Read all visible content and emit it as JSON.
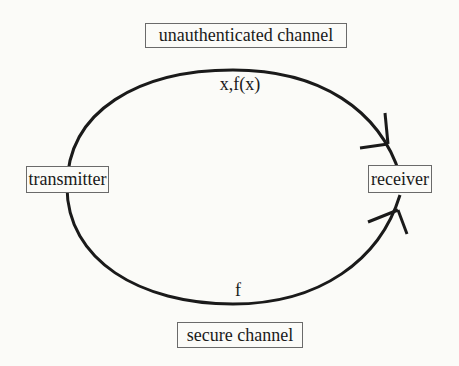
{
  "diagram": {
    "nodes": {
      "unauthenticated_channel": "unauthenticated channel",
      "transmitter": "transmitter",
      "receiver": "receiver",
      "secure_channel": "secure channel"
    },
    "edges": {
      "upper": {
        "label": "x,f(x)",
        "from": "transmitter",
        "to": "receiver",
        "channel": "unauthenticated channel"
      },
      "lower": {
        "label": "f",
        "from": "transmitter",
        "to": "receiver",
        "channel": "secure channel"
      }
    },
    "colors": {
      "line": "#1a1a1a",
      "box_border": "#6a6a6a",
      "background": "#fbfbf8"
    }
  }
}
